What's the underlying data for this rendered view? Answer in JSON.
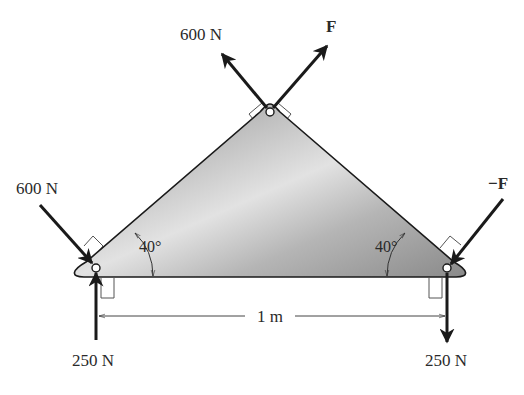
{
  "figure": {
    "plate_fill_light": "#d8d8d8",
    "plate_fill_dark": "#9a9a9a",
    "stroke_color": "#1a1a1a"
  },
  "forces": {
    "top_left": {
      "label": "600 N"
    },
    "top_right": {
      "label": "F"
    },
    "left_incoming": {
      "label": "600 N"
    },
    "right_incoming": {
      "label": "−F"
    },
    "left_reaction": {
      "label": "250 N",
      "direction": "up"
    },
    "right_reaction": {
      "label": "250 N",
      "direction": "down"
    }
  },
  "angles": {
    "left": "40°",
    "right": "40°"
  },
  "dimension": {
    "label": "1 m"
  }
}
